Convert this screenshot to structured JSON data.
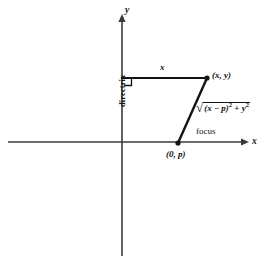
{
  "figure": {
    "axes": {
      "x_label": "x",
      "y_label": "y",
      "origin_x": 122,
      "origin_y": 142
    },
    "labels": {
      "directrix": "directrix",
      "horizontal_segment": "x",
      "point_xy": "(x, y)",
      "focus": "focus",
      "point_0p": "(0, p)"
    },
    "distance_expression": {
      "radical_sign": "√",
      "open_paren": "(",
      "var_x": "x",
      "minus": " − ",
      "var_p": "p",
      "close_paren": ")",
      "exp_two_a": "2",
      "plus": " + ",
      "var_y": "y",
      "exp_two_b": "2",
      "full_text": "√((x − p)² + y²)"
    },
    "geometry": {
      "point_xy_px": [
        207,
        78
      ],
      "point_focus_px": [
        178,
        143
      ],
      "directrix_foot_px": [
        124,
        78
      ],
      "right_angle_marker": true
    },
    "colors": {
      "stroke": "#141414",
      "axis": "#3a3a3a",
      "background": "#ffffff"
    }
  }
}
